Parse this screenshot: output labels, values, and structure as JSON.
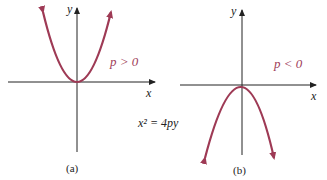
{
  "figure": {
    "equation": "x² = 4py",
    "curve_color": "#9e3a55",
    "axis_color": "#222222",
    "panels": [
      {
        "id": "a",
        "caption": "(a)",
        "condition": "p > 0",
        "x_label": "x",
        "y_label": "y",
        "opens": "up"
      },
      {
        "id": "b",
        "caption": "(b)",
        "condition": "p < 0",
        "x_label": "x",
        "y_label": "y",
        "opens": "down"
      }
    ]
  }
}
